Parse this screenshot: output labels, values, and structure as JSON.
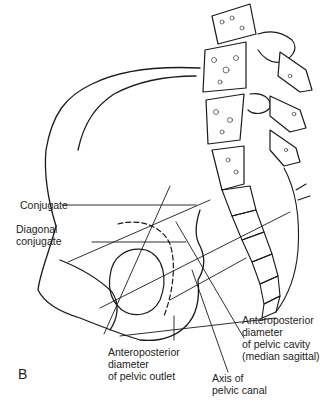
{
  "figure": {
    "panel_letter": "B",
    "labels": {
      "conjugate": "Conjugate",
      "diagonal_conjugate": [
        "Diagonal",
        "conjugate"
      ],
      "ap_pelvic_cavity": [
        "Anteroposterior",
        "diameter",
        "of pelvic cavity",
        "(median sagittal)"
      ],
      "ap_pelvic_outlet": [
        "Anteroposterior",
        "diameter",
        "of pelvic outlet"
      ],
      "axis_pelvic_canal": [
        "Axis of",
        "pelvic canal"
      ]
    },
    "caption_partial": "Figure 15.1 (B) Diameters of the pelvis (lateral view, illegible/cropped)"
  }
}
